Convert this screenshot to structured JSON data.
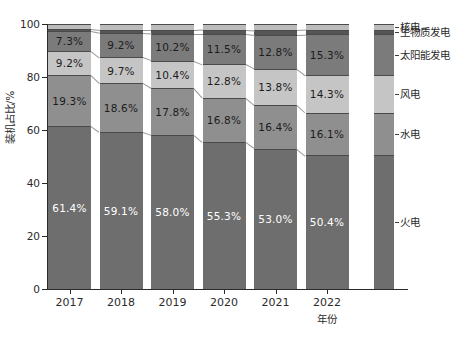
{
  "chart_data": {
    "type": "bar",
    "subtype": "stacked-100-percent",
    "title": "",
    "xlabel": "年份",
    "ylabel": "装机占比/%",
    "categories": [
      "2017",
      "2018",
      "2019",
      "2020",
      "2021",
      "2022"
    ],
    "ylim": [
      0,
      100
    ],
    "yticks": [
      0,
      20,
      40,
      60,
      80,
      100
    ],
    "grid": false,
    "legend_position": "right",
    "series": [
      {
        "name": "火电",
        "color": "#6e6e6e",
        "values": [
          61.4,
          59.1,
          58.0,
          55.3,
          53.0,
          50.4
        ],
        "labels": [
          "61.4%",
          "59.1%",
          "58.0%",
          "55.3%",
          "53.0%",
          "50.4%"
        ],
        "label_color": "light"
      },
      {
        "name": "水电",
        "color": "#8f8f8f",
        "values": [
          19.3,
          18.6,
          17.8,
          16.8,
          16.4,
          16.1
        ],
        "labels": [
          "19.3%",
          "18.6%",
          "17.8%",
          "16.8%",
          "16.4%",
          "16.1%"
        ],
        "label_color": "dark"
      },
      {
        "name": "风电",
        "color": "#c5c5c5",
        "values": [
          9.2,
          9.7,
          10.4,
          12.8,
          13.8,
          14.3
        ],
        "labels": [
          "9.2%",
          "9.7%",
          "10.4%",
          "12.8%",
          "13.8%",
          "14.3%"
        ],
        "label_color": "dark"
      },
      {
        "name": "太阳能发电",
        "color": "#7b7b7b",
        "values": [
          7.3,
          9.2,
          10.2,
          11.5,
          12.8,
          15.3
        ],
        "labels": [
          "7.3%",
          "9.2%",
          "10.2%",
          "11.5%",
          "12.8%",
          "15.3%"
        ],
        "label_color": "dark"
      },
      {
        "name": "生物质发电",
        "color": "#555555",
        "values": [
          0.9,
          1.1,
          1.3,
          1.5,
          1.7,
          1.8
        ],
        "labels": [
          "",
          "",
          "",
          "",
          "",
          ""
        ],
        "label_color": "dark"
      },
      {
        "name": "核电",
        "color": "#bcbcbc",
        "values": [
          1.9,
          2.3,
          2.3,
          2.1,
          2.3,
          2.1
        ],
        "labels": [
          "",
          "",
          "",
          "",
          "",
          ""
        ],
        "label_color": "dark"
      }
    ],
    "legend_entries": [
      {
        "label": "核电",
        "color": "#bcbcbc"
      },
      {
        "label": "生物质发电",
        "color": "#555555"
      },
      {
        "label": "太阳能发电",
        "color": "#7b7b7b"
      },
      {
        "label": "风电",
        "color": "#c5c5c5"
      },
      {
        "label": "水电",
        "color": "#8f8f8f"
      },
      {
        "label": "火电",
        "color": "#6e6e6e"
      }
    ]
  },
  "axes": {
    "ytick_labels": [
      "0",
      "20",
      "40",
      "60",
      "80",
      "100"
    ],
    "xtick_labels": [
      "2017",
      "2018",
      "2019",
      "2020",
      "2021",
      "2022"
    ],
    "ylabel": "装机占比/%",
    "xlabel": "年份"
  },
  "colors": {
    "axis": "#2b2b2b",
    "background": "#ffffff",
    "connector": "#9a9a9a"
  }
}
